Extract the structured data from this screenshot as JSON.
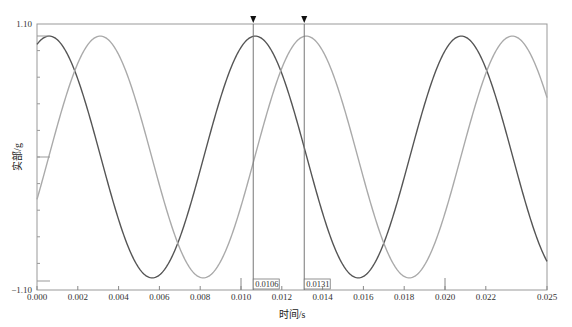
{
  "chart_data": {
    "type": "line",
    "title": "",
    "xlabel": "时间/s",
    "ylabel": "实部/g",
    "xlim": [
      0.0,
      0.025
    ],
    "ylim": [
      -1.1,
      1.1
    ],
    "x_ticks": [
      "0.000",
      "0.002",
      "0.004",
      "0.006",
      "0.008",
      "0.010",
      "0.012",
      "0.014",
      "0.016",
      "0.018",
      "0.020",
      "0.022",
      "0.025"
    ],
    "y_ticks": [
      "1.10",
      "-1.10"
    ],
    "grid": false,
    "series": [
      {
        "name": "dark",
        "color": "#555555",
        "amplitude": 1.0,
        "period": 0.0101,
        "peak_times": [
          0.0006,
          0.0106,
          0.0207
        ],
        "trough_times": [
          0.0056,
          0.0157
        ]
      },
      {
        "name": "light",
        "color": "#aaaaaa",
        "amplitude": 1.0,
        "period": 0.0101,
        "peak_times": [
          0.0031,
          0.0131,
          0.0232
        ],
        "trough_times": [
          0.0081,
          0.0182
        ]
      }
    ],
    "cursors": [
      {
        "x": 0.0106,
        "label": "0.0106"
      },
      {
        "x": 0.0131,
        "label": "0.0131"
      }
    ]
  },
  "labels": {
    "xlabel": "时间/s",
    "ylabel": "实部/g",
    "ymax": "1.10",
    "ymin": "−1.10",
    "cursor1": "0.0106",
    "cursor2": "0.0131"
  }
}
